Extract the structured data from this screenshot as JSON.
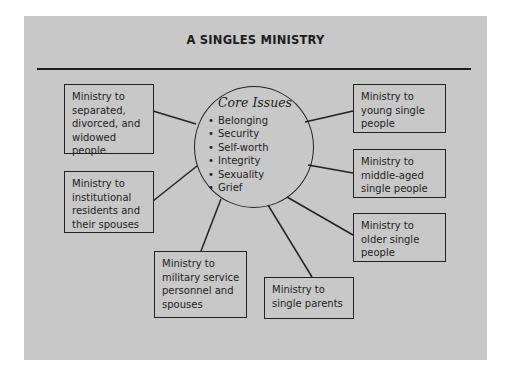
{
  "title": "A SINGLES MINISTRY",
  "core": {
    "heading": "Core Issues",
    "issues": [
      "Belonging",
      "Security",
      "Self-worth",
      "Integrity",
      "Sexuality",
      "Grief"
    ]
  },
  "ministries": [
    {
      "id": "separated",
      "label": "Ministry to\nseparated,\ndivorced, and\nwidowed people"
    },
    {
      "id": "institutional",
      "label": "Ministry to\ninstitutional\nresidents and\ntheir spouses"
    },
    {
      "id": "military",
      "label": "Ministry to\nmilitary service\npersonnel and\nspouses"
    },
    {
      "id": "single-parents",
      "label": "Ministry to\nsingle parents"
    },
    {
      "id": "older",
      "label": "Ministry to\nolder single\npeople"
    },
    {
      "id": "middle-aged",
      "label": "Ministry to\nmiddle-aged\nsingle people"
    },
    {
      "id": "young",
      "label": "Ministry to\nyoung single\npeople"
    }
  ],
  "colors": {
    "background": "#c8c8c8",
    "ink": "#222222"
  }
}
